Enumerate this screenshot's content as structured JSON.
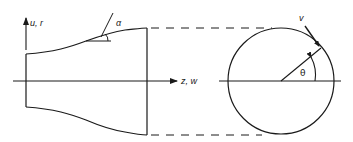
{
  "figure": {
    "colors": {
      "stroke": "#1a1a1a",
      "background": "#ffffff"
    },
    "labels": {
      "radial_axis": "u, r",
      "axial_axis": "z, w",
      "wall_angle": "α",
      "swirl_velocity": "v",
      "circumferential_angle": "θ"
    }
  }
}
